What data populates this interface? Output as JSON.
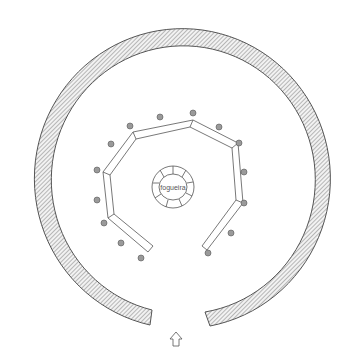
{
  "diagram": {
    "type": "floor-plan-sketch",
    "labels": {
      "fire": "fogueira"
    },
    "elements": {
      "outer_wall": "circular hatched wall with entrance gap at bottom",
      "benches": "segmented curved bench ring with posts",
      "fire": "stone-lined fire pit in center",
      "entrance_arrow": "arrow-up-icon"
    },
    "colors": {
      "line": "#555555",
      "hatch": "#888888",
      "post": "#8a8a8a",
      "background": "#ffffff"
    }
  }
}
